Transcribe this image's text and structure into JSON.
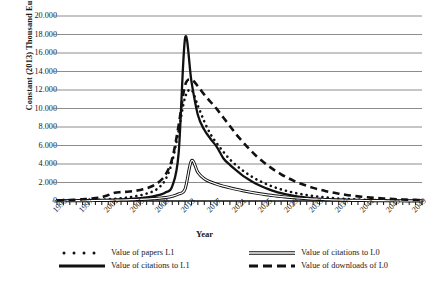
{
  "chart_data": {
    "type": "line",
    "title": "",
    "xlabel": "Year",
    "ylabel": "Constant (2013) Thousand Euro",
    "xlim": [
      1993,
      2050
    ],
    "ylim": [
      0,
      20000
    ],
    "ytick_labels": [
      "20.000",
      "18.000",
      "16.000",
      "14.000",
      "12.000",
      "10.000",
      "8.000",
      "6.000",
      "4.000",
      "2.000",
      "0"
    ],
    "ytick_values": [
      20000,
      18000,
      16000,
      14000,
      12000,
      10000,
      8000,
      6000,
      4000,
      2000,
      0
    ],
    "xtick_labels": [
      "1993",
      "1997",
      "2001",
      "2005",
      "2009",
      "2013",
      "2017",
      "2021",
      "2025",
      "2029",
      "2033",
      "2037",
      "2041",
      "2045",
      "2049"
    ],
    "xtick_values": [
      1993,
      1997,
      2001,
      2005,
      2009,
      2013,
      2017,
      2021,
      2025,
      2029,
      2033,
      2037,
      2041,
      2045,
      2049
    ],
    "minor_xticks": "yearly",
    "grid": "horizontal",
    "legend_position": "bottom",
    "x": [
      1993,
      1994,
      1995,
      1996,
      1997,
      1998,
      1999,
      2000,
      2001,
      2002,
      2003,
      2004,
      2005,
      2006,
      2007,
      2008,
      2009,
      2010,
      2011,
      2012,
      2013,
      2014,
      2015,
      2016,
      2017,
      2018,
      2019,
      2020,
      2021,
      2022,
      2023,
      2024,
      2025,
      2026,
      2027,
      2028,
      2029,
      2030,
      2031,
      2032,
      2033,
      2034,
      2035,
      2036,
      2037,
      2038,
      2039,
      2040,
      2041,
      2042,
      2043,
      2044,
      2045,
      2046,
      2047,
      2048,
      2049,
      2050
    ],
    "series": [
      {
        "name": "Value of papers L1",
        "style": "dotted",
        "values": [
          40,
          50,
          60,
          70,
          80,
          100,
          120,
          150,
          190,
          240,
          300,
          380,
          480,
          620,
          800,
          1050,
          1500,
          2400,
          4300,
          7600,
          11200,
          12000,
          10300,
          8600,
          7200,
          6200,
          5300,
          4500,
          3850,
          3300,
          2820,
          2400,
          2050,
          1740,
          1480,
          1250,
          1060,
          900,
          760,
          640,
          540,
          455,
          380,
          320,
          268,
          225,
          188,
          157,
          131,
          109,
          91,
          76,
          63,
          52,
          43,
          36,
          30,
          25
        ]
      },
      {
        "name": "Value of citations to L1",
        "style": "solid-thick",
        "values": [
          25,
          30,
          35,
          42,
          50,
          60,
          72,
          88,
          108,
          132,
          162,
          200,
          248,
          310,
          390,
          500,
          660,
          950,
          1600,
          5200,
          17600,
          12900,
          9300,
          7700,
          6700,
          5800,
          4600,
          3900,
          3300,
          2750,
          2300,
          1900,
          1560,
          1280,
          1040,
          840,
          680,
          550,
          445,
          360,
          290,
          234,
          188,
          151,
          121,
          97,
          78,
          62,
          50,
          40,
          32,
          26,
          21,
          17,
          13,
          11,
          9,
          7
        ]
      },
      {
        "name": "Value of citations to L0",
        "style": "double-line",
        "values": [
          20,
          24,
          28,
          33,
          39,
          46,
          54,
          64,
          76,
          90,
          107,
          127,
          151,
          179,
          212,
          252,
          300,
          380,
          520,
          760,
          1300,
          4350,
          3100,
          2400,
          2050,
          1800,
          1600,
          1420,
          1260,
          1110,
          980,
          860,
          750,
          650,
          560,
          480,
          410,
          350,
          297,
          252,
          213,
          180,
          152,
          128,
          108,
          91,
          76,
          64,
          54,
          45,
          38,
          32,
          27,
          22,
          19,
          16,
          13,
          11
        ]
      },
      {
        "name": "Value of downloads of L0",
        "style": "dashed-thick",
        "values": [
          60,
          80,
          105,
          140,
          185,
          245,
          320,
          420,
          640,
          900,
          960,
          1000,
          1080,
          1200,
          1380,
          1650,
          2100,
          2900,
          4600,
          8200,
          12500,
          13100,
          12400,
          11500,
          10700,
          9900,
          9000,
          8100,
          7200,
          6400,
          5650,
          4950,
          4350,
          3800,
          3320,
          2890,
          2510,
          2180,
          1890,
          1640,
          1420,
          1230,
          1060,
          915,
          790,
          680,
          585,
          503,
          430,
          368,
          315,
          268,
          228,
          194,
          164,
          139,
          117,
          99
        ]
      }
    ]
  },
  "legend": {
    "entries": [
      {
        "label": "Value of papers L1",
        "marker": "dotted-marker",
        "column": "left"
      },
      {
        "label": "Value of citations to L1",
        "marker": "solid-thick-marker",
        "column": "left"
      },
      {
        "label": "Value of citations to L0",
        "marker": "double-line-marker",
        "column": "right"
      },
      {
        "label": "Value of downloads of L0",
        "marker": "dashed-thick-marker",
        "column": "right"
      }
    ]
  },
  "colors": {
    "ink": "#111111",
    "grid": "#808080",
    "background": "#ffffff"
  }
}
